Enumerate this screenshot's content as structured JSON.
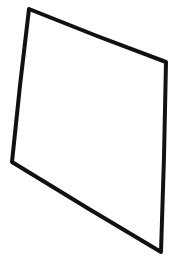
{
  "canvas": {
    "width": 171,
    "height": 263,
    "background": "#ffffff"
  },
  "shape": {
    "type": "quadrilateral",
    "style": "hand-drawn sketch",
    "stroke_color": "#111111",
    "stroke_width": 4,
    "fill": "none",
    "points": [
      [
        29,
        9
      ],
      [
        166,
        62
      ],
      [
        161,
        252
      ],
      [
        12,
        162
      ]
    ]
  }
}
